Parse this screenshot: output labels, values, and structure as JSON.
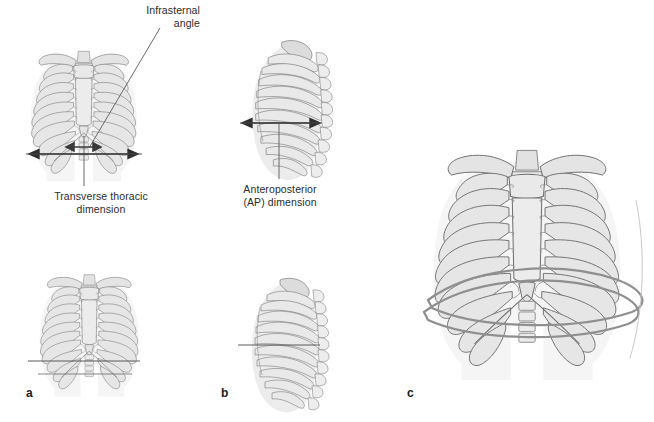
{
  "figure": {
    "background_color": "#ffffff",
    "ink_color": "#6d6d6d",
    "fill_light": "#ededed",
    "fill_mid": "#dcdcdc",
    "fill_dark": "#c9c9c9",
    "annotation_color": "#2b2b2b",
    "leader_color": "#5a5a5a"
  },
  "annotations": {
    "infrasternal_angle": "Infrasternal\nangle",
    "transverse_thoracic_dimension": "Transverse thoracic\ndimension",
    "ap_dimension": "Anteroposterior\n(AP) dimension"
  },
  "panels": [
    {
      "letter": "a",
      "view": "anterior view of thoracic cage",
      "measurement": "transverse thoracic dimension"
    },
    {
      "letter": "b",
      "view": "lateral view of thoracic cage",
      "measurement": "anteroposterior (AP) dimension"
    },
    {
      "letter": "c",
      "view": "anterior view with bucket-handle rib excursion highlighted",
      "measurement": ""
    }
  ],
  "caption_sliver": ""
}
